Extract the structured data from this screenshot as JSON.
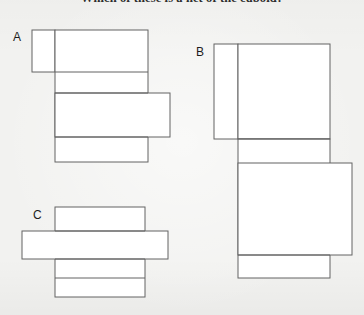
{
  "page": {
    "background_color": "#f2f2f0",
    "width": 364,
    "height": 315
  },
  "question": {
    "title": "Which of these is a net of the cuboid?"
  },
  "figure_style": {
    "stroke_color": "#636363",
    "fill_color": "#ffffff",
    "stroke_width": 1
  },
  "options": [
    {
      "id": "A",
      "label": "A",
      "label_position": {
        "x": 13,
        "y": 30
      },
      "description": "net-option-a",
      "rects": [
        {
          "name": "a-top-flap",
          "x": 32,
          "y": 30,
          "w": 23,
          "h": 42
        },
        {
          "name": "a-main-column",
          "x": 55,
          "y": 30,
          "w": 93,
          "h": 132
        },
        {
          "name": "a-side-flap",
          "x": 55,
          "y": 93,
          "w": 115,
          "h": 44
        }
      ],
      "lines": [
        {
          "name": "a-divider-top",
          "x1": 55,
          "y1": 72,
          "x2": 148,
          "y2": 72
        },
        {
          "name": "a-divider-middle",
          "x1": 55,
          "y1": 93,
          "x2": 148,
          "y2": 93
        },
        {
          "name": "a-divider-lower",
          "x1": 55,
          "y1": 137,
          "x2": 148,
          "y2": 137
        }
      ]
    },
    {
      "id": "B",
      "label": "B",
      "label_position": {
        "x": 196,
        "y": 45
      },
      "description": "net-option-b",
      "rects": [
        {
          "name": "b-left-flap",
          "x": 214,
          "y": 44,
          "w": 24,
          "h": 95
        },
        {
          "name": "b-top-panel",
          "x": 238,
          "y": 44,
          "w": 92,
          "h": 95
        },
        {
          "name": "b-bottom-column",
          "x": 238,
          "y": 139,
          "w": 92,
          "h": 139
        },
        {
          "name": "b-right-flap",
          "x": 238,
          "y": 163,
          "w": 114,
          "h": 92
        }
      ],
      "lines": [
        {
          "name": "b-divider-upper",
          "x1": 238,
          "y1": 139,
          "x2": 330,
          "y2": 139
        },
        {
          "name": "b-divider-lower",
          "x1": 238,
          "y1": 255,
          "x2": 330,
          "y2": 255
        }
      ]
    },
    {
      "id": "C",
      "label": "C",
      "label_position": {
        "x": 33,
        "y": 208
      },
      "description": "net-option-c",
      "rects": [
        {
          "name": "c-main-column",
          "x": 55,
          "y": 207,
          "w": 90,
          "h": 90
        },
        {
          "name": "c-cross-strip",
          "x": 22,
          "y": 231,
          "w": 146,
          "h": 28
        }
      ],
      "lines": [
        {
          "name": "c-divider-top",
          "x1": 55,
          "y1": 231,
          "x2": 145,
          "y2": 231
        },
        {
          "name": "c-divider-middle",
          "x1": 55,
          "y1": 259,
          "x2": 145,
          "y2": 259
        },
        {
          "name": "c-divider-lower",
          "x1": 55,
          "y1": 278,
          "x2": 145,
          "y2": 278
        }
      ]
    }
  ]
}
